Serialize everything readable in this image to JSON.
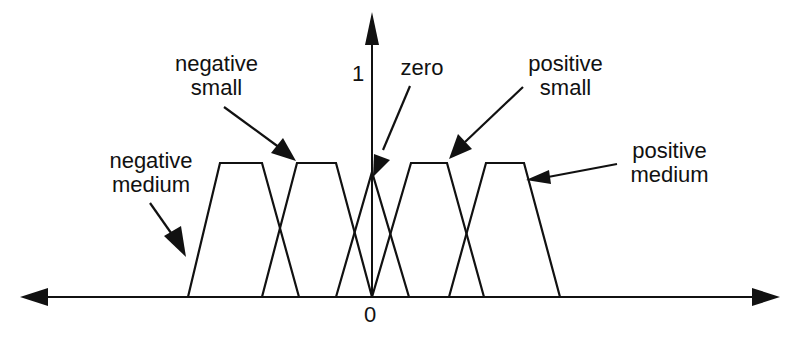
{
  "diagram": {
    "title": "",
    "type": "fuzzy membership functions",
    "axis": {
      "y_tick_label": "1",
      "x_origin_label": "0"
    },
    "sets": [
      {
        "id": "negative-medium",
        "label_line1": "negative",
        "label_line2": "medium",
        "shape": "trapezoid"
      },
      {
        "id": "negative-small",
        "label_line1": "negative",
        "label_line2": "small",
        "shape": "trapezoid"
      },
      {
        "id": "zero",
        "label_line1": "zero",
        "label_line2": "",
        "shape": "triangle"
      },
      {
        "id": "positive-small",
        "label_line1": "positive",
        "label_line2": "small",
        "shape": "trapezoid"
      },
      {
        "id": "positive-medium",
        "label_line1": "positive",
        "label_line2": "medium",
        "shape": "trapezoid"
      }
    ],
    "colors": {
      "line": "#111111",
      "background": "#ffffff"
    }
  }
}
